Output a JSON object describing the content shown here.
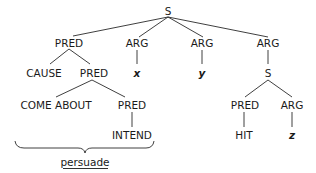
{
  "diagram": {
    "type": "syntax-tree",
    "root": {
      "label": "S",
      "children": [
        {
          "label": "PRED",
          "children": [
            {
              "label": "CAUSE"
            },
            {
              "label": "PRED",
              "children": [
                {
                  "label": "COME ABOUT"
                },
                {
                  "label": "PRED",
                  "children": [
                    {
                      "label": "INTEND"
                    }
                  ]
                }
              ]
            }
          ]
        },
        {
          "label": "ARG",
          "children": [
            {
              "label": "x"
            }
          ]
        },
        {
          "label": "ARG",
          "children": [
            {
              "label": "y"
            }
          ]
        },
        {
          "label": "ARG",
          "children": [
            {
              "label": "S",
              "children": [
                {
                  "label": "PRED",
                  "children": [
                    {
                      "label": "HIT"
                    }
                  ]
                },
                {
                  "label": "ARG",
                  "children": [
                    {
                      "label": "z"
                    }
                  ]
                }
              ]
            }
          ]
        }
      ]
    },
    "nodes": {
      "s_root": "S",
      "pred_1": "PRED",
      "arg_x": "ARG",
      "arg_y": "ARG",
      "arg_s": "ARG",
      "cause": "CAUSE",
      "pred_2": "PRED",
      "var_x": "x",
      "var_y": "y",
      "s_sub": "S",
      "come_about": "COME ABOUT",
      "pred_3": "PRED",
      "pred_hit": "PRED",
      "arg_z": "ARG",
      "intend": "INTEND",
      "hit": "HIT",
      "var_z": "z"
    },
    "brace_label": "persuade"
  }
}
